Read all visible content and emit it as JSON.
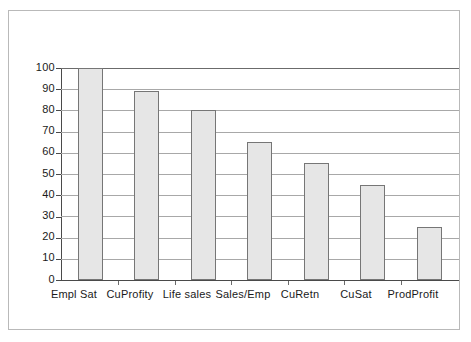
{
  "chart_data": {
    "type": "bar",
    "title": "",
    "subtitle": "",
    "xlabel": "",
    "ylabel": "",
    "categories": [
      "Empl Sat",
      "CuProfity",
      "Life sales",
      "Sales/Emp",
      "CuRetn",
      "CuSat",
      "ProdProfit"
    ],
    "values": [
      100,
      89,
      80,
      65,
      55,
      45,
      25
    ],
    "series": [
      {
        "name": "",
        "values": [
          100,
          89,
          80,
          65,
          55,
          45,
          25
        ]
      }
    ],
    "ylim": [
      0,
      100
    ],
    "ytick_labels": [
      "100",
      "90",
      "80",
      "70",
      "60",
      "50",
      "40",
      "30",
      "20",
      "10",
      "0"
    ],
    "ytick_values": [
      100,
      90,
      80,
      70,
      60,
      50,
      40,
      30,
      20,
      10,
      0
    ],
    "ytick_step": 10,
    "grid": true,
    "grid_axis": "y",
    "legend": false,
    "legend_position": "none",
    "annotations": [],
    "colors": {
      "bar_fill": "#e6e6e6",
      "bar_border": "#767676",
      "gridline": "#a8a8a8",
      "axis": "#4a4a4a",
      "frame_border": "#b9b9b9",
      "background": "#ffffff",
      "text": "#1a1a1a"
    }
  }
}
